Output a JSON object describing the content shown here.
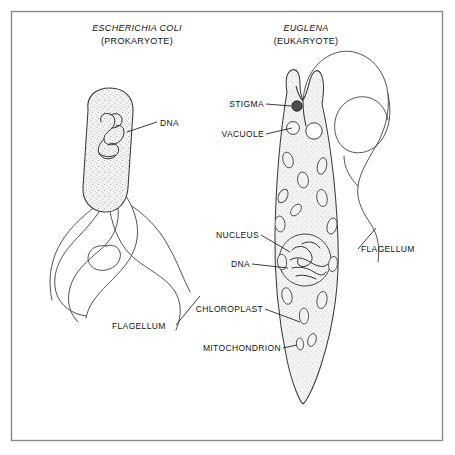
{
  "figure": {
    "width": 455,
    "height": 455,
    "background_color": "#ffffff",
    "border_color": "#8a8a8a",
    "ink_color": "#333333",
    "cytoplasm_color": "#e8e8e6",
    "organelle_color": "#f2f2f0",
    "stigma_color": "#4e4e4e"
  },
  "panels": [
    {
      "id": "prokaryote",
      "scientific_name": "ESCHERICHIA COLI",
      "cell_type": "(PROKARYOTE)",
      "title_center_x": 137,
      "title_top_y": 22
    },
    {
      "id": "eukaryote",
      "scientific_name": "EUGLENA",
      "cell_type": "(EUKARYOTE)",
      "title_center_x": 306,
      "title_top_y": 22
    }
  ],
  "labels": [
    {
      "id": "ecoli-dna",
      "text": "DNA",
      "panel": "prokaryote",
      "align": "left",
      "x": 160,
      "y": 120,
      "points_to": "bacterial-chromosome"
    },
    {
      "id": "ecoli-flagellum",
      "text": "FLAGELLUM",
      "panel": "prokaryote",
      "align": "left",
      "x": 112,
      "y": 323,
      "points_to": "bacterial-flagella"
    },
    {
      "id": "euglena-stigma",
      "text": "STIGMA",
      "panel": "eukaryote",
      "align": "right",
      "x": 232,
      "y": 101,
      "points_to": "stigma"
    },
    {
      "id": "euglena-vacuole",
      "text": "VACUOLE",
      "panel": "eukaryote",
      "align": "right",
      "x": 221,
      "y": 131,
      "points_to": "contractile-vacuole"
    },
    {
      "id": "euglena-nucleus",
      "text": "NUCLEUS",
      "panel": "eukaryote",
      "align": "right",
      "x": 213,
      "y": 232,
      "points_to": "nucleus"
    },
    {
      "id": "euglena-dna",
      "text": "DNA",
      "panel": "eukaryote",
      "align": "right",
      "x": 227,
      "y": 261,
      "points_to": "nuclear-dna"
    },
    {
      "id": "euglena-chloroplast",
      "text": "CHLOROPLAST",
      "panel": "eukaryote",
      "align": "right",
      "x": 195,
      "y": 306,
      "points_to": "chloroplast"
    },
    {
      "id": "euglena-mitochondrion",
      "text": "MITOCHONDRION",
      "panel": "eukaryote",
      "align": "right",
      "x": 190,
      "y": 345,
      "points_to": "mitochondrion"
    },
    {
      "id": "euglena-flagellum",
      "text": "FLAGELLUM",
      "panel": "eukaryote",
      "align": "left",
      "x": 361,
      "y": 246,
      "points_to": "euglena-flagellum-whip"
    }
  ],
  "structures": {
    "prokaryote": {
      "cell_shape": "capsule",
      "flagella_count": 4,
      "organelles": [
        "bacterial-chromosome"
      ]
    },
    "eukaryote": {
      "cell_shape": "spindle-tapered",
      "flagella_count": 1,
      "organelles": [
        "stigma",
        "contractile-vacuole",
        "nucleus",
        "nuclear-dna",
        "chloroplast",
        "mitochondrion"
      ],
      "chloroplast_count": 14
    }
  }
}
